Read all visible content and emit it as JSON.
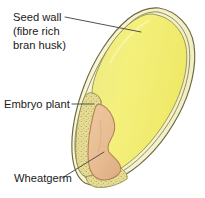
{
  "diagram": {
    "background_color": "#ffffff",
    "labels": [
      {
        "id": "seed-wall",
        "lines": [
          "Seed wall",
          "(fibre rich",
          "bran husk)"
        ],
        "line1": "Seed wall",
        "line2": "(fibre rich",
        "line3": "bran husk)"
      },
      {
        "id": "embryo-plant",
        "lines": [
          "Embryo plant"
        ],
        "line1": "Embryo plant"
      },
      {
        "id": "wheatgerm",
        "lines": [
          "Wheatgerm"
        ],
        "line1": "Wheatgerm"
      }
    ],
    "parts": [
      {
        "id": "seed-wall",
        "name": "Seed wall (bran husk)",
        "color": "#f7f4cf"
      },
      {
        "id": "endosperm",
        "name": "Endosperm",
        "color": "#f2ee78"
      },
      {
        "id": "embryo-plant",
        "name": "Embryo plant",
        "color": "#e6dc96"
      },
      {
        "id": "wheatgerm",
        "name": "Wheatgerm",
        "color": "#e8bc92"
      }
    ],
    "colors": {
      "outline": "#6b6a44",
      "leader": "#53524a",
      "text": "#1a1a1a",
      "endosperm": "#f2ee78",
      "husk": "#f7f4cf",
      "embryo_stipple_base": "#e6dc96",
      "embryo_stipple_dot": "#9a8f3c",
      "wheatgerm": "#e8bc92",
      "wheatgerm_edge": "#b98b5e"
    }
  }
}
